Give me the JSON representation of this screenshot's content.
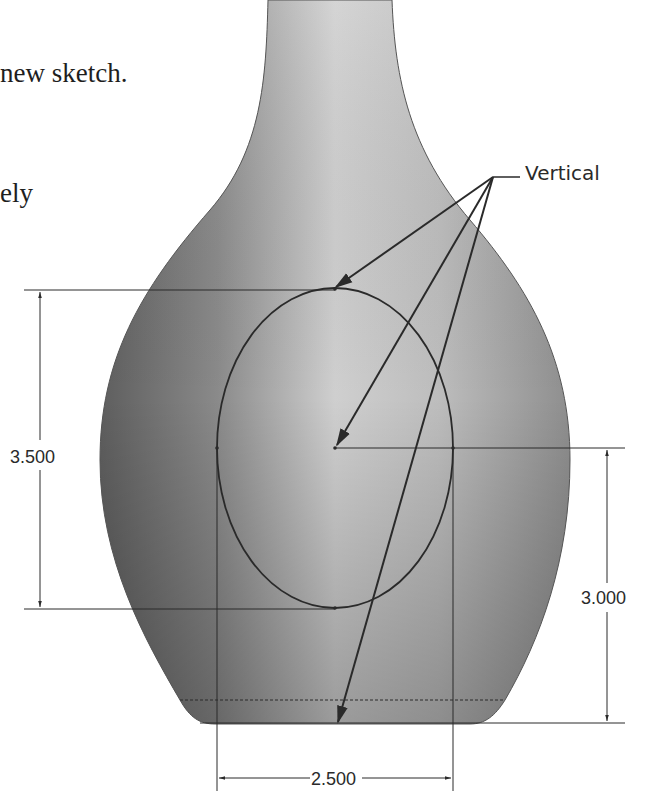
{
  "text": {
    "line1": "new sketch.",
    "line2": "ely"
  },
  "callout": {
    "label": "Vertical"
  },
  "dimensions": {
    "ellipse_height": "3.500",
    "center_to_base": "3.000",
    "ellipse_width": "2.500"
  },
  "colors": {
    "background": "#ffffff",
    "sketch_line": "#2a2a2a",
    "vase_dark": "#6a6a6a",
    "vase_light": "#d8d8d8"
  }
}
